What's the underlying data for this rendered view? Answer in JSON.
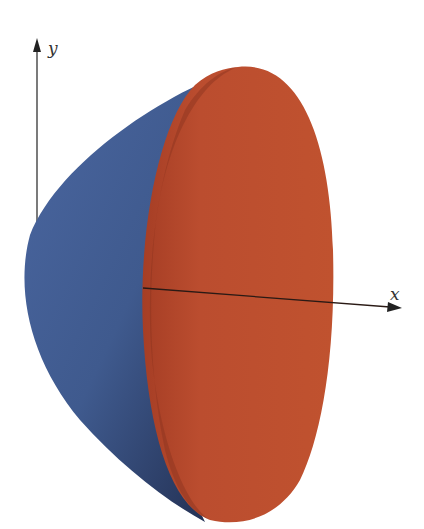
{
  "figure": {
    "axes": {
      "x_label": "x",
      "y_label": "y"
    },
    "colors": {
      "surface_outer": "#3f5a8e",
      "surface_outer_dark": "#2a3a62",
      "cross_section": "#b84a2e",
      "cross_section_dark": "#8a3220",
      "axis": "#333333",
      "background": "#ffffff"
    }
  }
}
